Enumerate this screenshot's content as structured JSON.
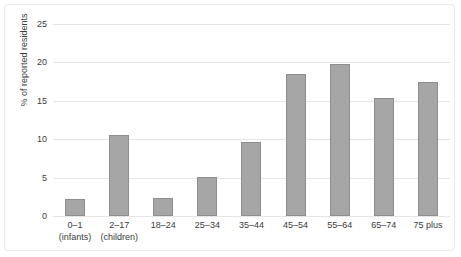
{
  "chart_data": {
    "type": "bar",
    "title": "",
    "subtitle": "",
    "xlabel": "",
    "ylabel": "% of reported residents",
    "ylim": [
      0,
      25
    ],
    "yticks": [
      0,
      5,
      10,
      15,
      20,
      25
    ],
    "ytick_labels": [
      "0",
      "5",
      "10",
      "15",
      "20",
      "25"
    ],
    "grid": "horizontal",
    "legend": "none",
    "bar_color": "#a6a6a6",
    "bar_edge_color": "#8e8e8e",
    "categories": [
      "0–1 (infants)",
      "2–17 (children)",
      "18–24",
      "25–34",
      "35–44",
      "45–54",
      "55–64",
      "65–74",
      "75 plus"
    ],
    "category_lines": [
      {
        "line1": "0–1",
        "line2": "(infants)"
      },
      {
        "line1": "2–17",
        "line2": "(children)"
      },
      {
        "line1": "18–24",
        "line2": ""
      },
      {
        "line1": "25–34",
        "line2": ""
      },
      {
        "line1": "35–44",
        "line2": ""
      },
      {
        "line1": "45–54",
        "line2": ""
      },
      {
        "line1": "55–64",
        "line2": ""
      },
      {
        "line1": "65–74",
        "line2": ""
      },
      {
        "line1": "75 plus",
        "line2": ""
      }
    ],
    "values": [
      2.2,
      10.5,
      2.4,
      5.1,
      9.6,
      18.5,
      19.8,
      15.4,
      17.5
    ]
  }
}
